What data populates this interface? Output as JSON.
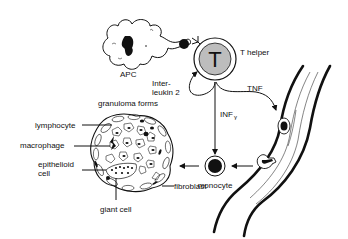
{
  "diagram": {
    "nodes": {
      "apc": {
        "label": "APC"
      },
      "t_helper": {
        "label": "T helper",
        "glyph": "T",
        "fill": "#bdbdbd"
      },
      "monocyte": {
        "label": "monocyte"
      },
      "granuloma": {
        "title": "granuloma forms"
      },
      "blood_vessel": {
        "label": ""
      }
    },
    "edges": {
      "interleukin": {
        "label_line1": "Inter-",
        "label_line2": "leukin 2"
      },
      "tnf": {
        "label": "TNF"
      },
      "infg": {
        "label": "INF",
        "sub": "γ"
      }
    },
    "granuloma_labels": {
      "lymphocyte": "lymphocyte",
      "macrophage": "macrophage",
      "epithelioid_1": "epithelioid",
      "epithelioid_2": "cell",
      "giant_cell": "giant cell",
      "fibroblast": "fibroblast"
    }
  }
}
